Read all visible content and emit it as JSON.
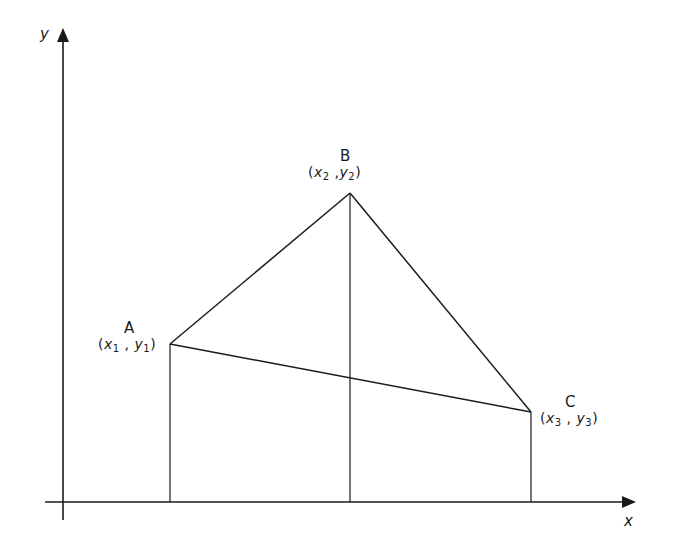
{
  "diagram": {
    "type": "coordinate-triangle",
    "axes": {
      "x_label": "x",
      "y_label": "y"
    },
    "points": [
      {
        "name": "A",
        "x_var": "x",
        "x_sub": "1",
        "y_var": "y",
        "y_sub": "1",
        "px": [
          170,
          344
        ]
      },
      {
        "name": "B",
        "x_var": "x",
        "x_sub": "2",
        "y_var": "y",
        "y_sub": "2",
        "px": [
          350,
          193
        ]
      },
      {
        "name": "C",
        "x_var": "x",
        "x_sub": "3",
        "y_var": "y",
        "y_sub": "3",
        "px": [
          531,
          412
        ]
      }
    ],
    "edges": [
      [
        "A",
        "B"
      ],
      [
        "B",
        "C"
      ],
      [
        "A",
        "C"
      ]
    ],
    "projections": [
      "A",
      "B",
      "C"
    ],
    "line_color": "#1a1a1a",
    "background": "#ffffff"
  }
}
